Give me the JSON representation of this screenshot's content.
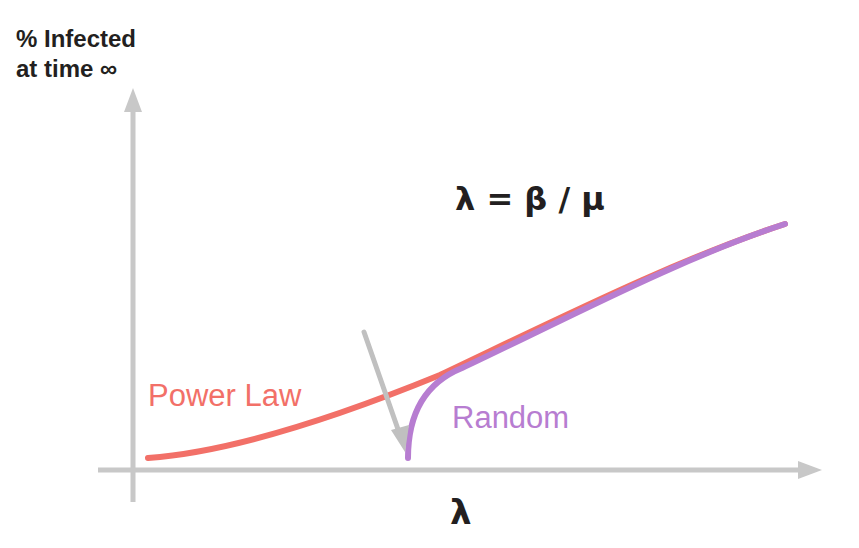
{
  "diagram": {
    "y_axis_label_line1": "% Infected",
    "y_axis_label_line2": "at time ∞",
    "x_axis_label": "λ",
    "formula": "λ = β / μ",
    "series": [
      {
        "name": "Power Law",
        "color": "#f27068"
      },
      {
        "name": "Random",
        "color": "#b77dd1"
      }
    ],
    "axis_color": "#c8c8c8",
    "arrow_annotation": "points to epidemic threshold of Random network",
    "arrow_color": "#c0c0c0"
  }
}
